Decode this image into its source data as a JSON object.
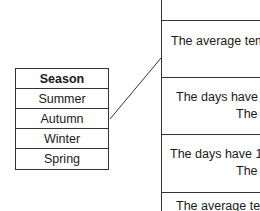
{
  "left_table": {
    "header": "Season",
    "items": [
      "Summer",
      "Autumn",
      "Winter",
      "Spring"
    ]
  },
  "right_table": {
    "rows": [
      {
        "line1": "",
        "line2": ""
      },
      {
        "line1": "The average temp",
        "line2": ""
      },
      {
        "line1": "The days have 1",
        "line2": "The av"
      },
      {
        "line1": "The days have 1.",
        "line2": "The av"
      },
      {
        "line1": "The average tem",
        "line2": ""
      }
    ]
  },
  "connections": [
    {
      "from": "Summer",
      "to_row": 1
    }
  ]
}
